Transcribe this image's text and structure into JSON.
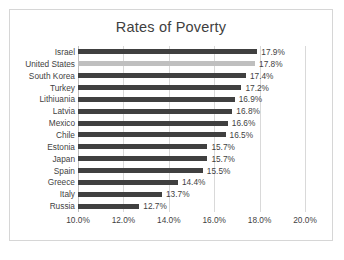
{
  "chart_data": {
    "type": "bar",
    "orientation": "horizontal",
    "title": "Rates of Poverty",
    "xlabel": "",
    "ylabel": "",
    "xlim": [
      10.0,
      20.0
    ],
    "xticks": [
      10.0,
      12.0,
      14.0,
      16.0,
      18.0,
      20.0
    ],
    "xtick_labels": [
      "10.0%",
      "12.0%",
      "14.0%",
      "16.0%",
      "18.0%",
      "20.0%"
    ],
    "grid": true,
    "legend": false,
    "value_suffix": "%",
    "bar_color": "#404040",
    "highlight_color": "#bfbfbf",
    "highlight_category": "United States",
    "categories": [
      "Israel",
      "United States",
      "South Korea",
      "Turkey",
      "Lithiuania",
      "Latvia",
      "Mexico",
      "Chile",
      "Estonia",
      "Japan",
      "Spain",
      "Greece",
      "Italy",
      "Russia"
    ],
    "values": [
      17.9,
      17.8,
      17.4,
      17.2,
      16.9,
      16.8,
      16.6,
      16.5,
      15.7,
      15.7,
      15.5,
      14.4,
      13.7,
      12.7
    ],
    "data_labels": [
      "17.9%",
      "17.8%",
      "17.4%",
      "17.2%",
      "16.9%",
      "16.8%",
      "16.6%",
      "16.5%",
      "15.7%",
      "15.7%",
      "15.5%",
      "14.4%",
      "13.7%",
      "12.7%"
    ]
  }
}
